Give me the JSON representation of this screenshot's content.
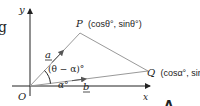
{
  "diagram": {
    "axes": {
      "x_label": "x",
      "y_label": "y",
      "origin_label": "O"
    },
    "points": {
      "P": {
        "name": "P",
        "coords": "(cosθ°, sinθ°)"
      },
      "Q": {
        "name": "Q",
        "coords": "(cosα°, sinα°)"
      }
    },
    "vectors": {
      "a": "a",
      "b": "b"
    },
    "angles": {
      "between": "(θ − α)°",
      "alpha": "α°"
    },
    "fragments": {
      "left_edge_glyph": "g",
      "bottom_right_glyph": "A"
    },
    "colors": {
      "lines": "#222222",
      "triangle": "#999999",
      "text": "#222222"
    }
  }
}
